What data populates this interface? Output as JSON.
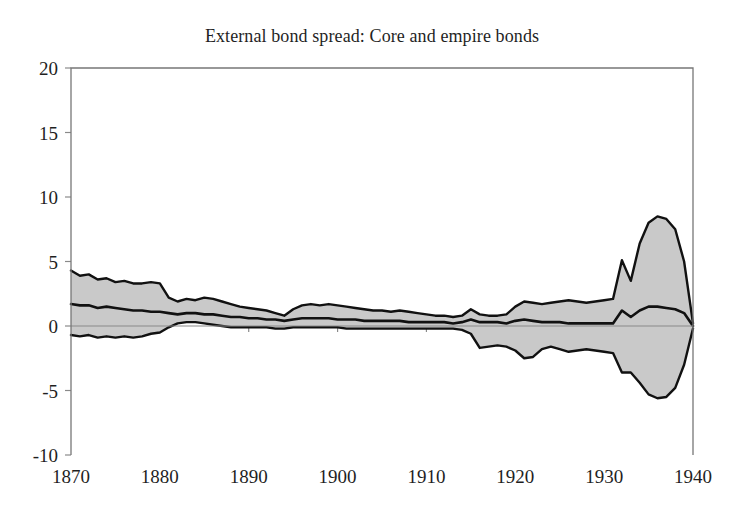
{
  "chart_data": {
    "type": "area",
    "title": "External bond spread: Core and empire bonds",
    "xlabel": "",
    "ylabel": "",
    "xlim": [
      1870,
      1940
    ],
    "ylim": [
      -10,
      20
    ],
    "grid": false,
    "legend": "none",
    "xticks": [
      1870,
      1880,
      1890,
      1900,
      1910,
      1920,
      1930,
      1940
    ],
    "xtick_labels": [
      "1870",
      "1880",
      "1890",
      "1900",
      "1910",
      "1920",
      "1930",
      "1940"
    ],
    "yticks": [
      -10,
      -5,
      0,
      5,
      10,
      15,
      20
    ],
    "ytick_labels": [
      "-10",
      "-5",
      "0",
      "5",
      "10",
      "15",
      "20"
    ],
    "band_fill_color": "#c9c9c9",
    "line_color": "#111111",
    "frame_color": "#777777",
    "x": [
      1870,
      1871,
      1872,
      1873,
      1874,
      1875,
      1876,
      1877,
      1878,
      1879,
      1880,
      1881,
      1882,
      1883,
      1884,
      1885,
      1886,
      1887,
      1888,
      1889,
      1890,
      1891,
      1892,
      1893,
      1894,
      1895,
      1896,
      1897,
      1898,
      1899,
      1900,
      1901,
      1902,
      1903,
      1904,
      1905,
      1906,
      1907,
      1908,
      1909,
      1910,
      1911,
      1912,
      1913,
      1914,
      1915,
      1916,
      1917,
      1918,
      1919,
      1920,
      1921,
      1922,
      1923,
      1924,
      1925,
      1926,
      1927,
      1928,
      1929,
      1930,
      1931,
      1932,
      1933,
      1934,
      1935,
      1936,
      1937,
      1938,
      1939,
      1940
    ],
    "series": [
      {
        "name": "Upper band",
        "values": [
          4.3,
          3.9,
          4.0,
          3.6,
          3.7,
          3.4,
          3.5,
          3.3,
          3.3,
          3.4,
          3.3,
          2.2,
          1.9,
          2.1,
          2.0,
          2.2,
          2.1,
          1.9,
          1.7,
          1.5,
          1.4,
          1.3,
          1.2,
          1.0,
          0.8,
          1.3,
          1.6,
          1.7,
          1.6,
          1.7,
          1.6,
          1.5,
          1.4,
          1.3,
          1.2,
          1.2,
          1.1,
          1.2,
          1.1,
          1.0,
          0.9,
          0.8,
          0.8,
          0.7,
          0.8,
          1.3,
          0.9,
          0.8,
          0.8,
          0.9,
          1.5,
          1.9,
          1.8,
          1.7,
          1.8,
          1.9,
          2.0,
          1.9,
          1.8,
          1.9,
          2.0,
          2.1,
          5.1,
          3.5,
          6.4,
          8.0,
          8.5,
          8.3,
          7.5,
          5.0,
          0.2
        ]
      },
      {
        "name": "Median / mean spread",
        "values": [
          1.7,
          1.6,
          1.6,
          1.4,
          1.5,
          1.4,
          1.3,
          1.2,
          1.2,
          1.1,
          1.1,
          1.0,
          0.9,
          1.0,
          1.0,
          0.9,
          0.9,
          0.8,
          0.7,
          0.7,
          0.6,
          0.6,
          0.5,
          0.5,
          0.4,
          0.5,
          0.6,
          0.6,
          0.6,
          0.6,
          0.5,
          0.5,
          0.5,
          0.4,
          0.4,
          0.4,
          0.4,
          0.4,
          0.3,
          0.3,
          0.3,
          0.3,
          0.3,
          0.2,
          0.3,
          0.5,
          0.3,
          0.3,
          0.3,
          0.2,
          0.4,
          0.5,
          0.4,
          0.3,
          0.3,
          0.3,
          0.2,
          0.2,
          0.2,
          0.2,
          0.2,
          0.2,
          1.2,
          0.7,
          1.2,
          1.5,
          1.5,
          1.4,
          1.3,
          1.0,
          0.0
        ]
      },
      {
        "name": "Lower band",
        "values": [
          -0.7,
          -0.8,
          -0.7,
          -0.9,
          -0.8,
          -0.9,
          -0.8,
          -0.9,
          -0.8,
          -0.6,
          -0.5,
          -0.1,
          0.2,
          0.3,
          0.3,
          0.2,
          0.1,
          0.0,
          -0.1,
          -0.1,
          -0.1,
          -0.1,
          -0.1,
          -0.2,
          -0.2,
          -0.1,
          -0.1,
          -0.1,
          -0.1,
          -0.1,
          -0.1,
          -0.2,
          -0.2,
          -0.2,
          -0.2,
          -0.2,
          -0.2,
          -0.2,
          -0.2,
          -0.2,
          -0.2,
          -0.2,
          -0.2,
          -0.2,
          -0.3,
          -0.6,
          -1.7,
          -1.6,
          -1.5,
          -1.6,
          -1.9,
          -2.5,
          -2.4,
          -1.8,
          -1.6,
          -1.8,
          -2.0,
          -1.9,
          -1.8,
          -1.9,
          -2.0,
          -2.1,
          -3.6,
          -3.6,
          -4.4,
          -5.3,
          -5.6,
          -5.5,
          -4.8,
          -3.0,
          -0.2
        ]
      }
    ]
  }
}
